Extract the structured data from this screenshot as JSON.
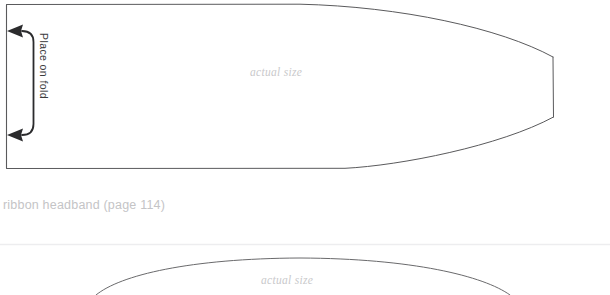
{
  "page": {
    "background_color": "#ffffff",
    "width": 610,
    "height": 295
  },
  "pattern_top": {
    "name": "ribbon-headband-pattern",
    "actual_size_label": "actual size",
    "fold_marker": {
      "label": "Place on fold",
      "arrow_count": 2,
      "arrow_direction": "left",
      "color": "#2b2b2d"
    },
    "outline_color": "#5a5a5c",
    "outline_width": 0.9
  },
  "caption": {
    "text": "ribbon headband (page 114)",
    "color": "#c4c4c6"
  },
  "divider": {
    "color": "#ededef"
  },
  "pattern_bottom": {
    "name": "second-pattern-piece",
    "actual_size_label": "actual size",
    "outline_color": "#6a6a6c",
    "outline_width": 0.9
  },
  "colors": {
    "outline": "#5a5a5c",
    "label_gray": "#c9c9cb",
    "caption_gray": "#c4c4c6",
    "fold_dark": "#2b2b2d",
    "divider": "#ededef"
  }
}
